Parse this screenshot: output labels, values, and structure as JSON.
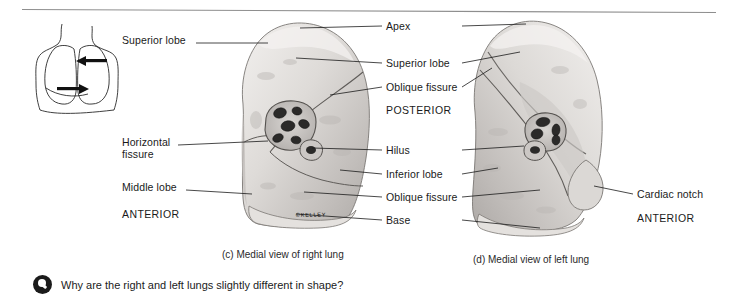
{
  "figure": {
    "top_rule": true,
    "artist_signature": "©KELLEY"
  },
  "inset": {
    "name": "thorax orientation inset",
    "arrow_count": 2
  },
  "labels_left": [
    {
      "key": "superior-lobe",
      "text": "Superior lobe",
      "x": 122,
      "y": 39
    },
    {
      "key": "horizontal-fissure-1",
      "text": "Horizontal",
      "x": 122,
      "y": 141
    },
    {
      "key": "horizontal-fissure-2",
      "text": "fissure",
      "x": 122,
      "y": 153
    },
    {
      "key": "middle-lobe",
      "text": "Middle lobe",
      "x": 122,
      "y": 186
    },
    {
      "key": "anterior-left",
      "text": "ANTERIOR",
      "x": 122,
      "y": 213
    }
  ],
  "labels_center": [
    {
      "key": "apex",
      "text": "Apex",
      "x": 386,
      "y": 22
    },
    {
      "key": "superior-lobe-c",
      "text": "Superior lobe",
      "x": 386,
      "y": 59
    },
    {
      "key": "oblique-fissure-upper",
      "text": "Oblique fissure",
      "x": 386,
      "y": 83
    },
    {
      "key": "posterior",
      "text": "POSTERIOR",
      "x": 386,
      "y": 106
    },
    {
      "key": "hilus",
      "text": "Hilus",
      "x": 386,
      "y": 146
    },
    {
      "key": "inferior-lobe",
      "text": "Inferior lobe",
      "x": 386,
      "y": 170
    },
    {
      "key": "oblique-fissure-lower",
      "text": "Oblique fissure",
      "x": 386,
      "y": 193
    },
    {
      "key": "base",
      "text": "Base",
      "x": 386,
      "y": 216
    }
  ],
  "labels_right": [
    {
      "key": "cardiac-notch",
      "text": "Cardiac notch",
      "x": 637,
      "y": 190
    },
    {
      "key": "anterior-right",
      "text": "ANTERIOR",
      "x": 637,
      "y": 214
    }
  ],
  "captions": {
    "right_lung": "(c) Medial view of right lung",
    "left_lung": "(d) Medial view of left lung"
  },
  "question": {
    "icon": "question-marker-icon",
    "text": "Why are the right and left lungs slightly different in shape?"
  },
  "colors": {
    "ink": "#1a1a1a",
    "rule": "#8e8e8e",
    "tissue_light": "#e9e7e5",
    "tissue_mid": "#cfccc9",
    "tissue_dark": "#a7a3a0",
    "hilus_dark": "#2b2a29"
  }
}
